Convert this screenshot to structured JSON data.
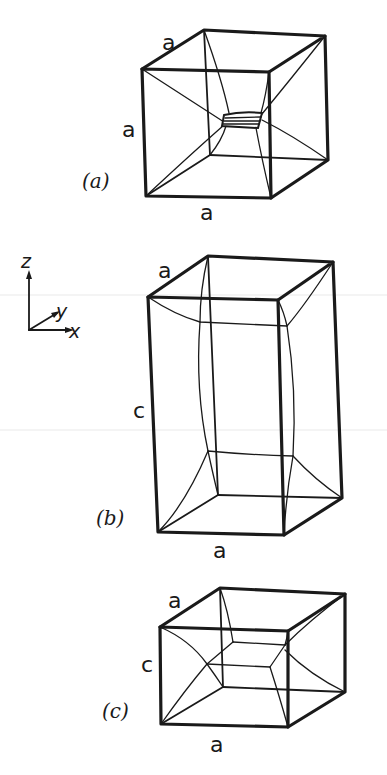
{
  "figure": {
    "panels": [
      {
        "id": "a",
        "caption": "(a)",
        "edge_labels": {
          "top": "a",
          "side": "a",
          "bottom": "a"
        },
        "description": "cube a×a×a with curved lines from corners meeting at small central hatched square"
      },
      {
        "id": "b",
        "caption": "(b)",
        "edge_labels": {
          "top": "a",
          "side": "c",
          "bottom": "a"
        },
        "description": "tall rectangular prism a×a×c with inner elongated cell"
      },
      {
        "id": "c",
        "caption": "(c)",
        "edge_labels": {
          "top": "a",
          "side": "c",
          "bottom": "a"
        },
        "description": "flattened rectangular prism a×a×c with inner flat cell"
      }
    ],
    "axes": {
      "z": "z",
      "y": "y",
      "x": "x"
    }
  }
}
